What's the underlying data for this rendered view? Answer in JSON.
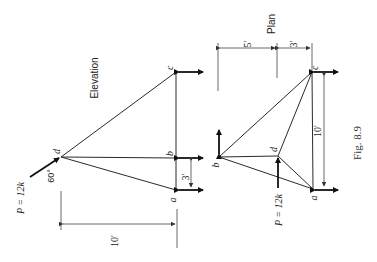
{
  "elevation": {
    "title": "Elevation",
    "joints": {
      "a": "a",
      "b": "b",
      "c": "c",
      "d": "d"
    },
    "load_label": "P = 12k",
    "angle_label": "60°",
    "dim_ab": "3'",
    "dim_span": "10'"
  },
  "plan": {
    "title": "Plan",
    "joints": {
      "a": "a",
      "b": "b",
      "c": "c",
      "d": "d"
    },
    "load_label": "P = 12k",
    "dim_left": "5'",
    "dim_right": "3'",
    "dim_ca": "10'"
  },
  "caption": "Fig. 8.9"
}
